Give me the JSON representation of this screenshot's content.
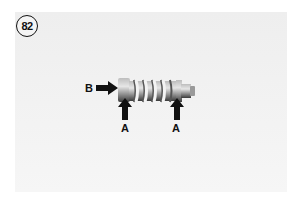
{
  "figure": {
    "number": "82",
    "labels": {
      "b": "B",
      "a_left": "A",
      "a_right": "A"
    }
  }
}
